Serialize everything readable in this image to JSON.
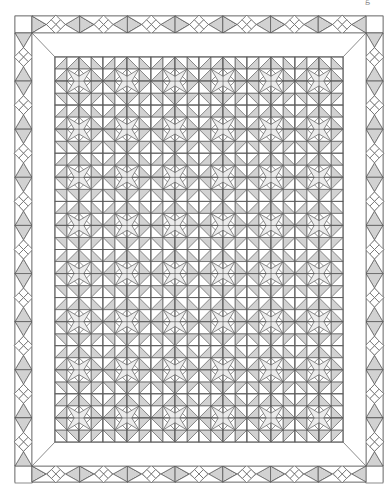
{
  "diagram": {
    "type": "quilt-layout",
    "caption_fragment": "g",
    "colors": {
      "background": "#ffffff",
      "line": "#5a5a5a",
      "shade": "#d2d2d2",
      "light_shade": "#ececec",
      "border_fill": "#ffffff"
    },
    "outer_border": {
      "x0": 15,
      "y0": 16,
      "x1": 383,
      "y1": 482,
      "strip_width": 17,
      "units_horizontal": 7,
      "units_vertical": 9,
      "unit_motif": [
        "shaded-triangle",
        "four-diamond-cluster",
        "shaded-triangle"
      ]
    },
    "plain_border": {
      "x0": 32,
      "y0": 33,
      "x1": 366,
      "y1": 466
    },
    "center_field": {
      "x0": 55,
      "y0": 57,
      "x1": 343,
      "y1": 442,
      "blocks_across": 6,
      "blocks_down": 8,
      "block_grid": 4,
      "block_motif": "star-and-triangles"
    }
  }
}
